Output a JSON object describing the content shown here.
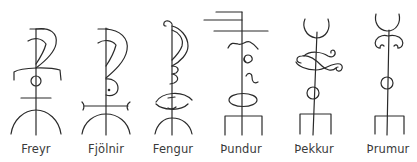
{
  "figure": {
    "background": "#ffffff",
    "ink_color": "#2a2a2a",
    "symbols": [
      {
        "name": "Freyr",
        "label_x": 36
      },
      {
        "name": "Fjölnir",
        "label_x": 106
      },
      {
        "name": "Fengur",
        "label_x": 173
      },
      {
        "name": "Þundur",
        "label_x": 241
      },
      {
        "name": "Þekkur",
        "label_x": 314
      },
      {
        "name": "Þrumur",
        "label_x": 388
      }
    ]
  }
}
